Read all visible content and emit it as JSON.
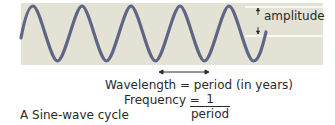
{
  "diagram": {
    "labels": {
      "amplitude": "amplitude",
      "wavelength": "Wavelength = period (in years)",
      "frequency_prefix": "Frequency =",
      "frequency_numerator": "1",
      "frequency_denominator": "period",
      "caption": "A   Sine-wave cycle"
    },
    "colors": {
      "panel_background": "#e4e2d4",
      "wave": "#5f6685",
      "guide_lines": "#ffffff",
      "text": "#2a2a2a"
    }
  }
}
